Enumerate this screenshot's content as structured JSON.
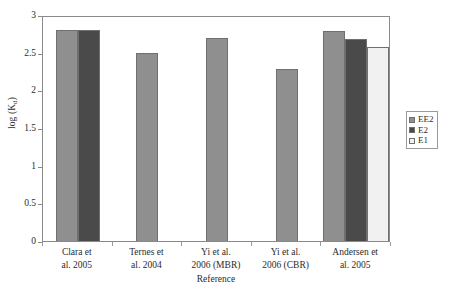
{
  "chart_data": {
    "type": "bar",
    "title": "",
    "xlabel": "Reference",
    "ylabel": "log (Kd)",
    "ylabel_base": "log (K",
    "ylabel_sub": "d",
    "ylabel_tail": ")",
    "ylim": [
      0,
      3
    ],
    "grid": false,
    "legend_position": "right",
    "y_ticks": [
      "0",
      "0.5",
      "1",
      "1.5",
      "2",
      "2.5",
      "3"
    ],
    "y_tick_values": [
      0,
      0.5,
      1,
      1.5,
      2,
      2.5,
      3
    ],
    "categories": [
      "Clara et al. 2005",
      "Ternes et al. 2004",
      "Yi et al. 2006 (MBR)",
      "Yi et al. 2006 (CBR)",
      "Andersen et al. 2005"
    ],
    "categories_lines": [
      [
        "Clara et",
        "al. 2005"
      ],
      [
        "Ternes et",
        "al. 2004"
      ],
      [
        "Yi et al.",
        "2006 (MBR)"
      ],
      [
        "Yi et al.",
        "2006 (CBR)"
      ],
      [
        "Andersen et",
        "al. 2005"
      ]
    ],
    "series": [
      {
        "name": "EE2",
        "color": "#8f8f8f",
        "values": [
          2.8,
          2.5,
          2.7,
          2.29,
          2.79
        ]
      },
      {
        "name": "E2",
        "color": "#4a4a4a",
        "values": [
          2.8,
          null,
          null,
          null,
          2.68
        ]
      },
      {
        "name": "E1",
        "color": "#f1f1f1",
        "values": [
          null,
          null,
          null,
          null,
          2.58
        ]
      }
    ]
  },
  "legend": {
    "items": [
      {
        "label": "EE2",
        "color": "#8f8f8f"
      },
      {
        "label": "E2",
        "color": "#4a4a4a"
      },
      {
        "label": "E1",
        "color": "#f1f1f1"
      }
    ]
  },
  "axes": {
    "y_title": "log (Kd)",
    "x_title": "Reference"
  }
}
